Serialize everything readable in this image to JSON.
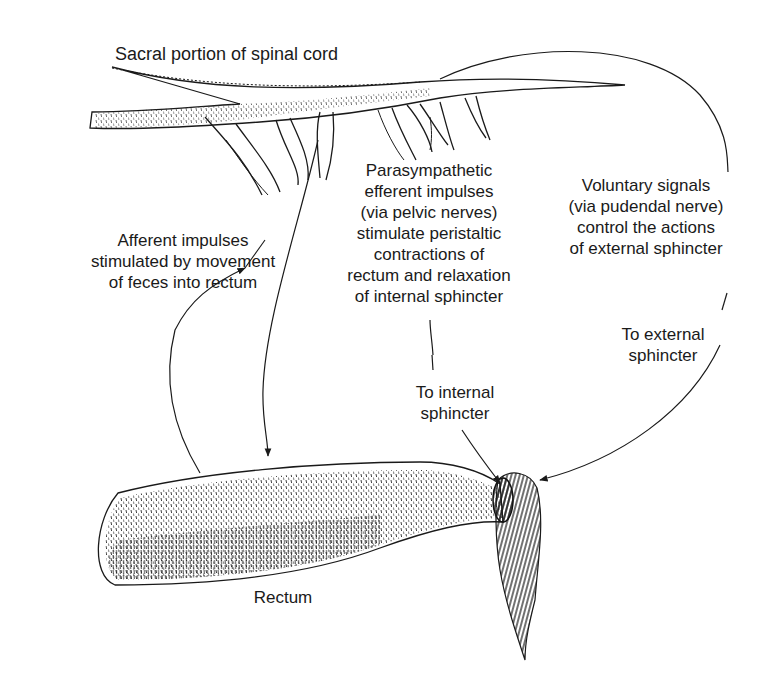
{
  "diagram": {
    "colors": {
      "ink": "#1a1a1a",
      "background": "#ffffff"
    },
    "labels": {
      "spinal_cord": "Sacral portion of spinal cord",
      "afferent": "Afferent impulses\nstimulated by movement\nof feces into rectum",
      "parasympathetic": "Parasympathetic\nefferent impulses\n(via pelvic nerves)\nstimulate peristaltic\ncontractions of\nrectum and relaxation\nof internal sphincter",
      "voluntary": "Voluntary signals\n(via pudendal nerve)\ncontrol the actions\nof external sphincter",
      "to_internal": "To internal\nsphincter",
      "to_external": "To external\nsphincter",
      "rectum": "Rectum"
    },
    "structures": [
      "spinal-cord",
      "nerve-roots",
      "rectum",
      "internal-sphincter",
      "external-sphincter"
    ],
    "arrows": [
      {
        "from": "rectum",
        "to": "spinal-cord",
        "meaning": "afferent"
      },
      {
        "from": "spinal-cord",
        "to": "rectum",
        "meaning": "parasympathetic efferent"
      },
      {
        "from": "spinal-cord",
        "to": "internal-sphincter",
        "meaning": "efferent"
      },
      {
        "from": "spinal-cord",
        "to": "external-sphincter",
        "meaning": "voluntary via pudendal nerve"
      }
    ]
  }
}
